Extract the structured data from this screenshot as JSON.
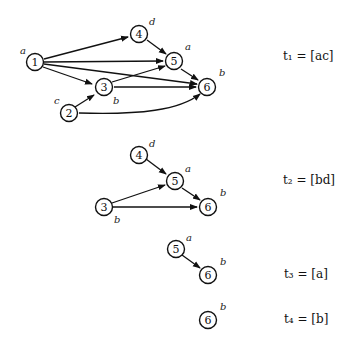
{
  "graphs": [
    {
      "caption": "t₁ = [ac]",
      "nodes": [
        {
          "id": "1",
          "label": "a"
        },
        {
          "id": "2",
          "label": "c"
        },
        {
          "id": "3",
          "label": "b"
        },
        {
          "id": "4",
          "label": "d"
        },
        {
          "id": "5",
          "label": "a"
        },
        {
          "id": "6",
          "label": "b"
        }
      ],
      "edges": [
        [
          "1",
          "4"
        ],
        [
          "1",
          "5"
        ],
        [
          "1",
          "3"
        ],
        [
          "1",
          "6"
        ],
        [
          "4",
          "5"
        ],
        [
          "5",
          "6"
        ],
        [
          "3",
          "5"
        ],
        [
          "3",
          "6"
        ],
        [
          "2",
          "3"
        ],
        [
          "2",
          "6"
        ]
      ]
    },
    {
      "caption": "t₂ = [bd]",
      "nodes": [
        {
          "id": "4",
          "label": "d"
        },
        {
          "id": "5",
          "label": "a"
        },
        {
          "id": "3",
          "label": "b"
        },
        {
          "id": "6",
          "label": "b"
        }
      ],
      "edges": [
        [
          "4",
          "5"
        ],
        [
          "3",
          "5"
        ],
        [
          "3",
          "6"
        ],
        [
          "5",
          "6"
        ]
      ]
    },
    {
      "caption": "t₃ = [a]",
      "nodes": [
        {
          "id": "5",
          "label": "a"
        },
        {
          "id": "6",
          "label": "b"
        }
      ],
      "edges": [
        [
          "5",
          "6"
        ]
      ]
    },
    {
      "caption": "t₄ = [b]",
      "nodes": [
        {
          "id": "6",
          "label": "b"
        }
      ],
      "edges": []
    }
  ]
}
